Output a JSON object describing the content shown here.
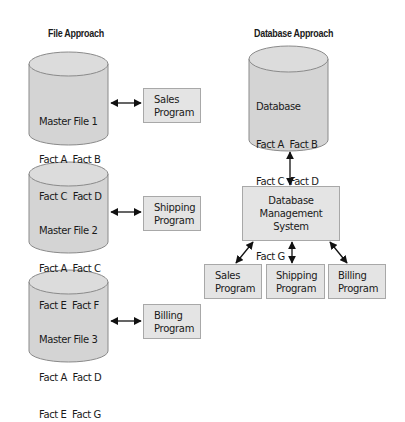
{
  "file_approach": {
    "title": "File Approach",
    "files": [
      {
        "name": "Master File 1",
        "facts_row1": "Fact A  Fact B",
        "facts_row2": "Fact C  Fact D",
        "program": [
          "Sales",
          "Program"
        ]
      },
      {
        "name": "Master File 2",
        "facts_row1": "Fact A  Fact C",
        "facts_row2": "Fact E  Fact F",
        "program": [
          "Shipping",
          "Program"
        ]
      },
      {
        "name": "Master File 3",
        "facts_row1": "Fact A  Fact D",
        "facts_row2": "Fact E  Fact G",
        "program": [
          "Billing",
          "Program"
        ]
      }
    ]
  },
  "database_approach": {
    "title": "Database Approach",
    "database": {
      "name": "Database",
      "rows": [
        "Fact A  Fact B",
        "Fact C  Fact D",
        "Fact E  Fact F",
        "Fact G"
      ]
    },
    "dbms": [
      "Database",
      "Management",
      "System"
    ],
    "programs": [
      [
        "Sales",
        "Program"
      ],
      [
        "Shipping",
        "Program"
      ],
      [
        "Billing",
        "Program"
      ]
    ]
  },
  "colors": {
    "cylinder_fill": "#d4d4d4",
    "cylinder_top": "#dcdcdc",
    "cylinder_stroke": "#8a8a8a",
    "box_fill": "#e4e4e4",
    "box_stroke": "#a8a8a8",
    "arrow": "#111111"
  }
}
